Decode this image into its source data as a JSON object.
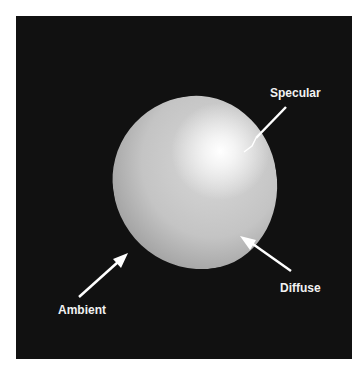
{
  "diagram": {
    "title": "",
    "labels": {
      "specular": "Specular",
      "diffuse": "Diffuse",
      "ambient": "Ambient"
    },
    "colors": {
      "background": "#111111",
      "page": "#ffffff",
      "arrow": "#ffffff",
      "label": "#f2f2f2"
    }
  }
}
